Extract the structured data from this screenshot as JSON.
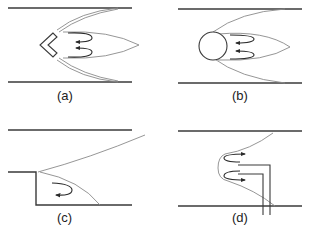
{
  "diagram": {
    "panels": [
      {
        "id": "a",
        "label": "(a)",
        "holder": "v-gutter (chevron bluff body)",
        "features": [
          "duct walls",
          "double shear layers",
          "recirculation zone",
          "two reverse-flow arrows"
        ]
      },
      {
        "id": "b",
        "label": "(b)",
        "holder": "cylinder (circular bluff body)",
        "features": [
          "duct walls",
          "shear layers",
          "recirculation zone",
          "two reverse-flow arrows"
        ]
      },
      {
        "id": "c",
        "label": "(c)",
        "holder": "backward-facing step",
        "features": [
          "duct walls",
          "step",
          "shear layer",
          "recirculation vortex arrow"
        ]
      },
      {
        "id": "d",
        "label": "(d)",
        "holder": "opposed jet / pilot injection tubes",
        "features": [
          "duct walls",
          "injection tubes",
          "flame front",
          "two forward-flow arrows"
        ]
      }
    ]
  },
  "colors": {
    "wall": "#3a3a3a",
    "streamline": "#8a8a8a",
    "arrow": "#2a2a2a",
    "background": "#ffffff"
  }
}
